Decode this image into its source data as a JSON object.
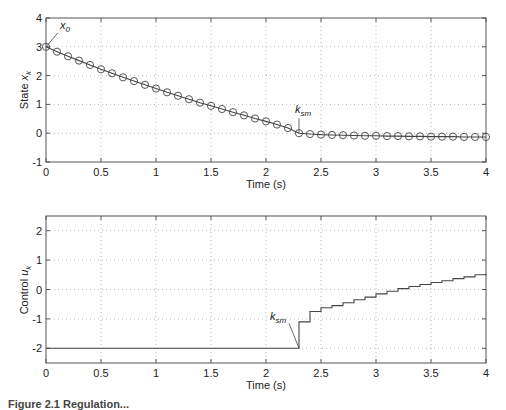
{
  "chart_data": [
    {
      "type": "line",
      "title": "",
      "xlabel": "Time (s)",
      "ylabel": "State x_k",
      "ylabel_main": "State ",
      "ylabel_var": "x",
      "ylabel_sub": "k",
      "xlim": [
        0,
        4
      ],
      "ylim": [
        -1,
        4
      ],
      "xticks": [
        "0",
        "0.5",
        "1",
        "1.5",
        "2",
        "2.5",
        "3",
        "3.5",
        "4"
      ],
      "yticks": [
        "-1",
        "0",
        "1",
        "2",
        "3",
        "4"
      ],
      "grid": true,
      "marker": "circle",
      "series": [
        {
          "name": "x_k",
          "x": [
            0,
            0.1,
            0.2,
            0.3,
            0.4,
            0.5,
            0.6,
            0.7,
            0.8,
            0.9,
            1.0,
            1.1,
            1.2,
            1.3,
            1.4,
            1.5,
            1.6,
            1.7,
            1.8,
            1.9,
            2.0,
            2.1,
            2.2,
            2.3,
            2.4,
            2.5,
            2.6,
            2.7,
            2.8,
            2.9,
            3.0,
            3.1,
            3.2,
            3.3,
            3.4,
            3.5,
            3.6,
            3.7,
            3.8,
            3.9,
            4.0
          ],
          "values": [
            3.0,
            2.83,
            2.67,
            2.52,
            2.37,
            2.22,
            2.08,
            1.94,
            1.81,
            1.68,
            1.55,
            1.42,
            1.3,
            1.18,
            1.06,
            0.95,
            0.84,
            0.73,
            0.62,
            0.51,
            0.41,
            0.3,
            0.18,
            0.0,
            -0.03,
            -0.05,
            -0.06,
            -0.07,
            -0.08,
            -0.09,
            -0.09,
            -0.1,
            -0.1,
            -0.11,
            -0.11,
            -0.12,
            -0.12,
            -0.12,
            -0.13,
            -0.13,
            -0.13
          ]
        }
      ],
      "annotations": [
        {
          "text": "x",
          "sub": "0",
          "x": 0,
          "y": 3.0
        },
        {
          "text": "k",
          "sub": "sm",
          "x": 2.3,
          "y": 0.0
        }
      ]
    },
    {
      "type": "line",
      "step": true,
      "title": "",
      "xlabel": "Time (s)",
      "ylabel": "Control u_k",
      "ylabel_main": "Control ",
      "ylabel_var": "u",
      "ylabel_sub": "k",
      "xlim": [
        0,
        4
      ],
      "ylim": [
        -2.5,
        2.5
      ],
      "xticks": [
        "0",
        "0.5",
        "1",
        "1.5",
        "2",
        "2.5",
        "3",
        "3.5",
        "4"
      ],
      "yticks": [
        "-2",
        "-1",
        "0",
        "1",
        "2"
      ],
      "grid": true,
      "series": [
        {
          "name": "u_k",
          "x": [
            0,
            2.3,
            2.4,
            2.5,
            2.6,
            2.7,
            2.8,
            2.9,
            3.0,
            3.1,
            3.2,
            3.3,
            3.4,
            3.5,
            3.6,
            3.7,
            3.8,
            3.9,
            4.0
          ],
          "values": [
            -2.0,
            -1.1,
            -0.75,
            -0.62,
            -0.55,
            -0.45,
            -0.35,
            -0.26,
            -0.15,
            -0.06,
            0.03,
            0.1,
            0.17,
            0.24,
            0.3,
            0.37,
            0.43,
            0.5,
            0.53
          ]
        }
      ],
      "annotations": [
        {
          "text": "k",
          "sub": "sm",
          "x": 2.3,
          "y": -2.0
        }
      ]
    }
  ],
  "caption": "Figure 2.1  Regulation..."
}
